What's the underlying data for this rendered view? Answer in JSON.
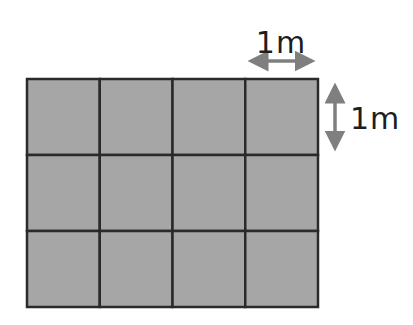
{
  "diagram": {
    "type": "grid-area-figure",
    "grid": {
      "columns": 4,
      "rows": 3,
      "x": 27,
      "y": 79,
      "width": 291,
      "height": 228,
      "fill_color": "#a6a6a6",
      "line_color": "#2a2a2a"
    },
    "horizontal_dimension": {
      "label": "1m",
      "arrow_color": "#7f7f7f",
      "x1": 245,
      "x2": 318,
      "y": 61,
      "label_x": 281,
      "label_y": 53
    },
    "vertical_dimension": {
      "label": "1m",
      "arrow_color": "#7f7f7f",
      "x": 335,
      "y1": 80,
      "y2": 154,
      "label_x": 350,
      "label_y": 129
    }
  }
}
